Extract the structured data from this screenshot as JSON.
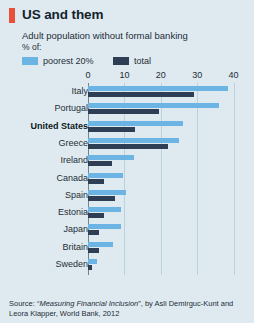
{
  "header": {
    "title": "US and them",
    "subtitle": "Adult population without formal banking",
    "unit": "% of:",
    "mark_color": "#e8503a"
  },
  "legend": {
    "items": [
      {
        "label": "poorest 20%",
        "color": "#6cb4e4",
        "key": "poorest"
      },
      {
        "label": "total",
        "color": "#2e3e54",
        "key": "total"
      }
    ]
  },
  "source": {
    "prefix": "Source: “",
    "title": "Measuring Financial Inclusion",
    "suffix": "”, by Asli Demirguc-Kunt and Leora Klapper, World Bank, 2012"
  },
  "chart_data": {
    "type": "bar",
    "orientation": "horizontal",
    "title": "US and them",
    "subtitle": "Adult population without formal banking",
    "xlabel": "% of:",
    "ylabel": "",
    "xlim": [
      0,
      44
    ],
    "xticks": [
      0,
      10,
      20,
      30,
      40
    ],
    "xtick_labels": [
      "0",
      "10",
      "20",
      "30",
      "40"
    ],
    "grid": true,
    "legend_position": "top",
    "highlight_category": "United States",
    "categories": [
      "Italy",
      "Portugal",
      "United States",
      "Greece",
      "Ireland",
      "Canada",
      "Spain",
      "Estonia",
      "Japan",
      "Britain",
      "Sweden"
    ],
    "series": [
      {
        "name": "poorest 20%",
        "color": "#6cb4e4",
        "values": [
          38.5,
          36.0,
          26.0,
          25.0,
          12.5,
          9.5,
          10.5,
          9.0,
          9.0,
          7.0,
          2.5
        ]
      },
      {
        "name": "total",
        "color": "#2e3e54",
        "values": [
          29.0,
          19.5,
          13.0,
          22.0,
          6.5,
          4.5,
          7.5,
          4.5,
          3.0,
          3.0,
          1.2
        ]
      }
    ]
  }
}
